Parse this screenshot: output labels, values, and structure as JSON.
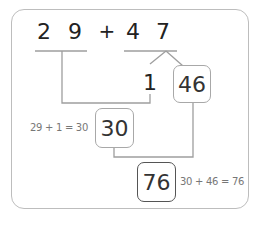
{
  "diagram": {
    "problem": {
      "first_tens": "2",
      "first_ones": "9",
      "operator": "+",
      "second_tens": "4",
      "second_ones": "7"
    },
    "split": {
      "part_small": "1",
      "part_large": "46"
    },
    "step1": {
      "result": "30",
      "note": "29 + 1 = 30"
    },
    "step2": {
      "result": "76",
      "note": "30 + 46 = 76"
    },
    "colors": {
      "line": "#9e9e9e",
      "frame": "#bdbdbd",
      "text": "#222222",
      "note": "#777777",
      "final_box_border": "#555555"
    }
  }
}
